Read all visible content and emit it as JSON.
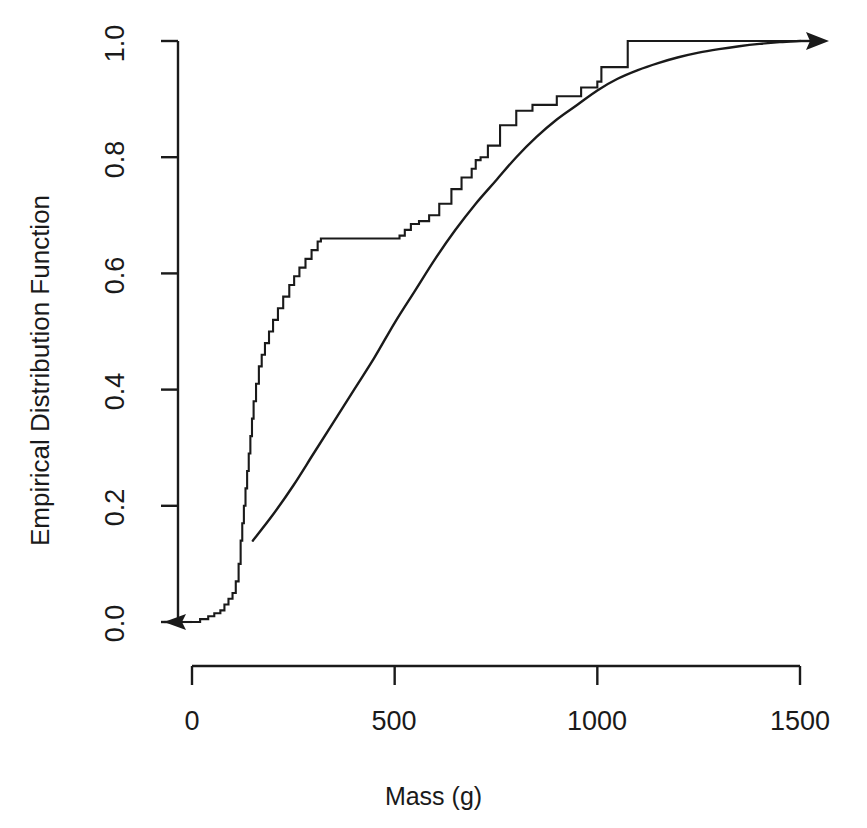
{
  "title_fragment": "E.D.F. PLOT",
  "axes": {
    "xlabel": "Mass (g)",
    "ylabel": "Empirical Distribution Function",
    "xticks": [
      "0",
      "500",
      "1000",
      "1500"
    ],
    "yticks": [
      "0.0",
      "0.2",
      "0.4",
      "0.6",
      "0.8",
      "1.0"
    ]
  },
  "chart_data": {
    "type": "line",
    "title": "E.D.F. PLOT",
    "xlabel": "Mass (g)",
    "ylabel": "Empirical Distribution Function",
    "xlim": [
      0,
      1500
    ],
    "ylim": [
      0.0,
      1.0
    ],
    "xticks": [
      0,
      500,
      1000,
      1500
    ],
    "yticks": [
      0.0,
      0.2,
      0.4,
      0.6,
      0.8,
      1.0
    ],
    "grid": false,
    "legend": null,
    "series": [
      {
        "name": "Empirical distribution function (step)",
        "style": "step",
        "color": "#1a1a1a",
        "arrow_start": "left-arrow-at-y0",
        "x": [
          0,
          20,
          40,
          55,
          70,
          80,
          90,
          100,
          108,
          115,
          120,
          124,
          128,
          132,
          136,
          140,
          144,
          148,
          152,
          158,
          165,
          172,
          180,
          190,
          200,
          212,
          225,
          240,
          252,
          265,
          280,
          295,
          310,
          318,
          324,
          330,
          500,
          512,
          525,
          540,
          560,
          585,
          610,
          640,
          665,
          690,
          700,
          712,
          730,
          760,
          800,
          840,
          900,
          960,
          1000,
          1010,
          1075,
          1500
        ],
        "y": [
          0.0,
          0.005,
          0.01,
          0.015,
          0.02,
          0.03,
          0.04,
          0.05,
          0.07,
          0.1,
          0.14,
          0.17,
          0.2,
          0.23,
          0.26,
          0.29,
          0.32,
          0.35,
          0.38,
          0.41,
          0.44,
          0.46,
          0.48,
          0.5,
          0.52,
          0.54,
          0.56,
          0.58,
          0.595,
          0.61,
          0.625,
          0.64,
          0.655,
          0.66,
          0.66,
          0.66,
          0.66,
          0.665,
          0.675,
          0.685,
          0.69,
          0.7,
          0.72,
          0.745,
          0.765,
          0.78,
          0.795,
          0.8,
          0.82,
          0.855,
          0.88,
          0.89,
          0.905,
          0.92,
          0.93,
          0.955,
          1.0,
          1.0
        ]
      },
      {
        "name": "Fitted theoretical distribution (smooth)",
        "style": "smooth",
        "color": "#1a1a1a",
        "arrow_end": "right-arrow",
        "x": [
          150,
          200,
          250,
          300,
          350,
          400,
          450,
          500,
          550,
          600,
          650,
          700,
          750,
          800,
          850,
          900,
          950,
          1000,
          1050,
          1100,
          1150,
          1200,
          1250,
          1300,
          1350,
          1400,
          1450,
          1500
        ],
        "y": [
          0.14,
          0.185,
          0.235,
          0.29,
          0.345,
          0.4,
          0.455,
          0.515,
          0.57,
          0.625,
          0.675,
          0.72,
          0.76,
          0.8,
          0.835,
          0.865,
          0.89,
          0.915,
          0.935,
          0.95,
          0.962,
          0.972,
          0.98,
          0.986,
          0.991,
          0.995,
          0.998,
          1.0
        ]
      }
    ]
  }
}
